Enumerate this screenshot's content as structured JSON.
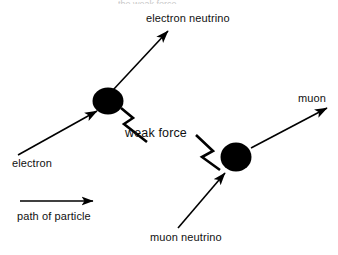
{
  "figure": {
    "title_clipped": "the weak force",
    "background_color": "#ffffff",
    "stroke_color": "#000000",
    "vertex_color": "#000000"
  },
  "labels": {
    "electron_neutrino": "electron neutrino",
    "muon": "muon",
    "weak_force": "weak force",
    "electron": "electron",
    "muon_neutrino": "muon neutrino"
  },
  "legend": {
    "arrow_caption": "path of particle"
  },
  "diagram_data": {
    "type": "feynman-style-interaction-diagram",
    "vertices": [
      {
        "name": "electron-vertex",
        "cx": 108,
        "cy": 101,
        "rx": 15,
        "ry": 13
      },
      {
        "name": "muon-vertex",
        "cx": 236,
        "cy": 157,
        "rx": 15,
        "ry": 14
      }
    ],
    "particle_arrows": [
      {
        "name": "electron-arrow",
        "particle": "electron",
        "direction": "incoming",
        "x1": 18,
        "y1": 155,
        "x2": 97,
        "y2": 111
      },
      {
        "name": "electron-neutrino-arrow",
        "particle": "electron neutrino",
        "direction": "outgoing",
        "x1": 113,
        "y1": 90,
        "x2": 168,
        "y2": 31
      },
      {
        "name": "muon-neutrino-arrow",
        "particle": "muon neutrino",
        "direction": "incoming",
        "x1": 178,
        "y1": 228,
        "x2": 225,
        "y2": 173
      },
      {
        "name": "muon-arrow",
        "particle": "muon",
        "direction": "outgoing",
        "x1": 251,
        "y1": 148,
        "x2": 327,
        "y2": 108
      }
    ],
    "force_carrier": {
      "name": "weak-force-zigzag",
      "label": "weak force",
      "left_segment_points": "121,108 133,118 124,124 146,141",
      "right_segment_points": "196,136 213,152 203,157 218,168"
    },
    "legend_arrow": {
      "x1": 20,
      "y1": 201,
      "x2": 93,
      "y2": 201
    }
  }
}
